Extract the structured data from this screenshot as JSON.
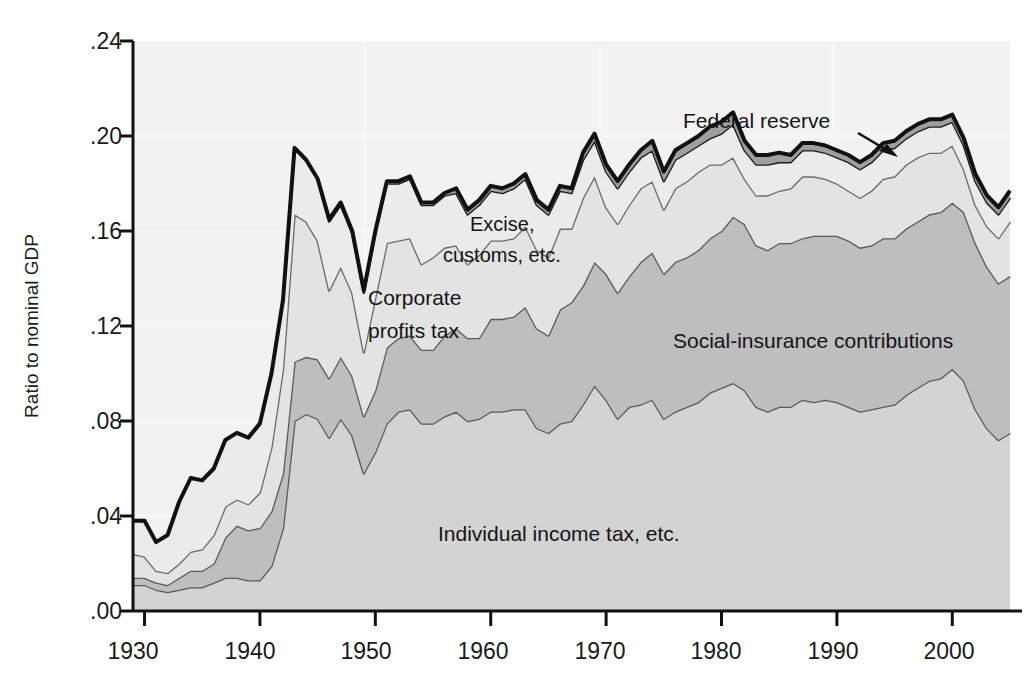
{
  "chart_data": {
    "type": "area",
    "stacked": true,
    "title": "",
    "subtitle": "",
    "xlabel": "",
    "ylabel": "Ratio to nominal GDP",
    "xlim": [
      1929,
      2005
    ],
    "ylim": [
      0.0,
      0.24
    ],
    "grid": false,
    "legend_position": "inline-annotations",
    "x_ticks": [
      "1930",
      "1940",
      "1950",
      "1960",
      "1970",
      "1980",
      "1990",
      "2000"
    ],
    "x_tick_values": [
      1930,
      1940,
      1950,
      1960,
      1970,
      1980,
      1990,
      2000
    ],
    "y_ticks": [
      ".00",
      ".04",
      ".08",
      ".12",
      ".16",
      ".20",
      ".24"
    ],
    "y_tick_values": [
      0.0,
      0.04,
      0.08,
      0.12,
      0.16,
      0.2,
      0.24
    ],
    "x": [
      1929,
      1930,
      1931,
      1932,
      1933,
      1934,
      1935,
      1936,
      1937,
      1938,
      1939,
      1940,
      1941,
      1942,
      1943,
      1944,
      1945,
      1946,
      1947,
      1948,
      1949,
      1950,
      1951,
      1952,
      1953,
      1954,
      1955,
      1956,
      1957,
      1958,
      1959,
      1960,
      1961,
      1962,
      1963,
      1964,
      1965,
      1966,
      1967,
      1968,
      1969,
      1970,
      1971,
      1972,
      1973,
      1974,
      1975,
      1976,
      1977,
      1978,
      1979,
      1980,
      1981,
      1982,
      1983,
      1984,
      1985,
      1986,
      1987,
      1988,
      1989,
      1990,
      1991,
      1992,
      1993,
      1994,
      1995,
      1996,
      1997,
      1998,
      1999,
      2000,
      2001,
      2002,
      2003,
      2004,
      2005
    ],
    "series": [
      {
        "name": "Individual income tax, etc.",
        "color": "#d3d3d3",
        "line_color": "#5a5a5a",
        "values": [
          0.011,
          0.011,
          0.009,
          0.008,
          0.009,
          0.01,
          0.01,
          0.012,
          0.014,
          0.014,
          0.013,
          0.013,
          0.019,
          0.035,
          0.08,
          0.083,
          0.081,
          0.073,
          0.081,
          0.074,
          0.058,
          0.067,
          0.079,
          0.084,
          0.085,
          0.079,
          0.079,
          0.082,
          0.084,
          0.08,
          0.081,
          0.084,
          0.084,
          0.085,
          0.085,
          0.077,
          0.075,
          0.079,
          0.08,
          0.087,
          0.095,
          0.089,
          0.081,
          0.086,
          0.087,
          0.089,
          0.081,
          0.084,
          0.086,
          0.088,
          0.092,
          0.094,
          0.096,
          0.093,
          0.086,
          0.084,
          0.086,
          0.086,
          0.089,
          0.088,
          0.089,
          0.088,
          0.086,
          0.084,
          0.085,
          0.086,
          0.087,
          0.091,
          0.094,
          0.097,
          0.098,
          0.102,
          0.097,
          0.085,
          0.077,
          0.072,
          0.075
        ]
      },
      {
        "name": "Social-insurance contributions",
        "color": "#bebebe",
        "line_color": "#5a5a5a",
        "values": [
          0.003,
          0.003,
          0.003,
          0.003,
          0.005,
          0.007,
          0.007,
          0.008,
          0.017,
          0.022,
          0.021,
          0.022,
          0.023,
          0.023,
          0.025,
          0.024,
          0.025,
          0.025,
          0.026,
          0.025,
          0.024,
          0.026,
          0.032,
          0.031,
          0.031,
          0.031,
          0.031,
          0.034,
          0.035,
          0.035,
          0.034,
          0.039,
          0.039,
          0.039,
          0.043,
          0.042,
          0.041,
          0.048,
          0.05,
          0.05,
          0.052,
          0.053,
          0.053,
          0.055,
          0.06,
          0.062,
          0.061,
          0.063,
          0.063,
          0.064,
          0.065,
          0.066,
          0.07,
          0.07,
          0.068,
          0.068,
          0.069,
          0.069,
          0.068,
          0.07,
          0.069,
          0.07,
          0.07,
          0.069,
          0.069,
          0.071,
          0.07,
          0.07,
          0.07,
          0.07,
          0.07,
          0.07,
          0.071,
          0.07,
          0.068,
          0.066,
          0.066
        ]
      },
      {
        "name": "Corporate profits tax",
        "color": "#e3e3e3",
        "line_color": "#6a6a6a",
        "values": [
          0.01,
          0.009,
          0.005,
          0.005,
          0.006,
          0.008,
          0.009,
          0.012,
          0.013,
          0.011,
          0.011,
          0.015,
          0.027,
          0.044,
          0.062,
          0.057,
          0.05,
          0.037,
          0.038,
          0.035,
          0.027,
          0.039,
          0.044,
          0.041,
          0.041,
          0.036,
          0.039,
          0.037,
          0.035,
          0.031,
          0.035,
          0.033,
          0.033,
          0.033,
          0.034,
          0.033,
          0.033,
          0.034,
          0.031,
          0.037,
          0.036,
          0.028,
          0.029,
          0.03,
          0.031,
          0.03,
          0.027,
          0.031,
          0.032,
          0.033,
          0.031,
          0.028,
          0.025,
          0.019,
          0.021,
          0.023,
          0.022,
          0.023,
          0.026,
          0.025,
          0.024,
          0.022,
          0.021,
          0.021,
          0.023,
          0.025,
          0.026,
          0.027,
          0.027,
          0.026,
          0.025,
          0.024,
          0.018,
          0.016,
          0.017,
          0.019,
          0.023
        ]
      },
      {
        "name": "Excise, customs, etc.",
        "color": "#ebebeb",
        "line_color": "#1a1a1a",
        "values": [
          0.014,
          0.015,
          0.012,
          0.016,
          0.026,
          0.031,
          0.029,
          0.028,
          0.028,
          0.028,
          0.028,
          0.029,
          0.031,
          0.029,
          0.028,
          0.026,
          0.026,
          0.029,
          0.026,
          0.025,
          0.025,
          0.027,
          0.025,
          0.024,
          0.025,
          0.025,
          0.022,
          0.022,
          0.022,
          0.021,
          0.021,
          0.021,
          0.02,
          0.021,
          0.02,
          0.019,
          0.018,
          0.016,
          0.015,
          0.016,
          0.015,
          0.015,
          0.015,
          0.014,
          0.013,
          0.013,
          0.012,
          0.012,
          0.012,
          0.011,
          0.011,
          0.013,
          0.014,
          0.012,
          0.013,
          0.013,
          0.012,
          0.011,
          0.011,
          0.011,
          0.011,
          0.011,
          0.012,
          0.012,
          0.012,
          0.012,
          0.012,
          0.011,
          0.011,
          0.011,
          0.011,
          0.01,
          0.01,
          0.01,
          0.01,
          0.01,
          0.01
        ]
      },
      {
        "name": "Federal reserve",
        "color": "#9e9e9e",
        "line_color": "#111111",
        "values": [
          0.0,
          0.0,
          0.0,
          0.0,
          0.0,
          0.0,
          0.0,
          0.0,
          0.0,
          0.0,
          0.0,
          0.0,
          0.0,
          0.0,
          0.0,
          0.0,
          0.0,
          0.001,
          0.001,
          0.001,
          0.001,
          0.001,
          0.001,
          0.001,
          0.001,
          0.001,
          0.001,
          0.001,
          0.002,
          0.002,
          0.002,
          0.002,
          0.002,
          0.002,
          0.002,
          0.002,
          0.002,
          0.002,
          0.002,
          0.003,
          0.003,
          0.003,
          0.003,
          0.003,
          0.003,
          0.004,
          0.004,
          0.004,
          0.004,
          0.004,
          0.005,
          0.005,
          0.005,
          0.004,
          0.004,
          0.004,
          0.004,
          0.003,
          0.003,
          0.003,
          0.003,
          0.003,
          0.003,
          0.003,
          0.003,
          0.003,
          0.003,
          0.003,
          0.003,
          0.003,
          0.003,
          0.003,
          0.003,
          0.003,
          0.003,
          0.003,
          0.003
        ]
      }
    ],
    "annotations": [
      {
        "text": "Federal reserve",
        "x": 0.755,
        "y": 0.175,
        "arrow": true
      },
      {
        "text": "Excise,",
        "x": 0.48,
        "y": 0.315
      },
      {
        "text": "customs, etc.",
        "x": 0.455,
        "y": 0.37
      },
      {
        "text": "Corporate",
        "x": 0.375,
        "y": 0.44
      },
      {
        "text": "profits tax",
        "x": 0.375,
        "y": 0.49
      },
      {
        "text": "Social-insurance contributions",
        "x": 0.665,
        "y": 0.5
      },
      {
        "text": "Individual income tax, etc.",
        "x": 0.43,
        "y": 0.78
      }
    ]
  },
  "axis": {
    "y_title": "Ratio to nominal GDP",
    "y_ticks": [
      ".24",
      ".20",
      ".16",
      ".12",
      ".08",
      ".04",
      ".00"
    ],
    "x_ticks": [
      "1930",
      "1940",
      "1950",
      "1960",
      "1970",
      "1980",
      "1990",
      "2000"
    ]
  },
  "labels": {
    "federal_reserve": "Federal reserve",
    "excise_line1": "Excise,",
    "excise_line2": "customs, etc.",
    "corporate_line1": "Corporate",
    "corporate_line2": "profits tax",
    "social_insurance": "Social-insurance contributions",
    "individual_income": "Individual income tax, etc."
  },
  "colors": {
    "individual": "#d3d3d3",
    "social": "#bebebe",
    "corporate": "#e3e3e3",
    "excise": "#ebebeb",
    "fed": "#9e9e9e",
    "outline": "#111111",
    "text": "#1a1a1a"
  }
}
